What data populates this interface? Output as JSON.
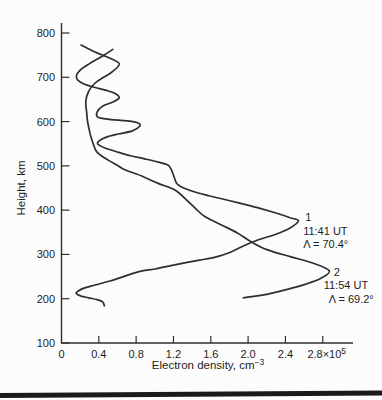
{
  "figure": {
    "bottom_rule_color": "#1a1a1a",
    "curve_color": "#2e2e2e",
    "text_color": "#1c1c1c"
  },
  "chart_data": {
    "type": "line",
    "title": "",
    "xlabel": "Electron density, cm",
    "xlabel_sup": "−3",
    "ylabel": "Height, km",
    "xlim": [
      0,
      3.12
    ],
    "ylim": [
      100,
      822
    ],
    "grid": false,
    "legend_position": "inline-annotations",
    "x_unit": "10^5 cm^-3",
    "x_ticks": [
      {
        "v": 0.0,
        "label": "0"
      },
      {
        "v": 0.4,
        "label": "0.4"
      },
      {
        "v": 0.8,
        "label": "0.8"
      },
      {
        "v": 1.2,
        "label": "1.2"
      },
      {
        "v": 1.6,
        "label": "1.6"
      },
      {
        "v": 2.0,
        "label": "2.0"
      },
      {
        "v": 2.4,
        "label": "2.4"
      },
      {
        "v": 2.8,
        "label": "2.8×10",
        "sup": "5"
      }
    ],
    "y_ticks": [
      {
        "v": 100,
        "label": "100"
      },
      {
        "v": 200,
        "label": "200"
      },
      {
        "v": 300,
        "label": "300"
      },
      {
        "v": 400,
        "label": "400"
      },
      {
        "v": 500,
        "label": "500"
      },
      {
        "v": 600,
        "label": "600"
      },
      {
        "v": 700,
        "label": "700"
      },
      {
        "v": 800,
        "label": "800"
      }
    ],
    "series": [
      {
        "name": "1",
        "time": "11:41 UT",
        "invariant_latitude": "Λ = 70.4°",
        "peak": {
          "density": 2.54,
          "height_km": 376
        },
        "points": [
          [
            0.55,
            763
          ],
          [
            0.44,
            748
          ],
          [
            0.31,
            732
          ],
          [
            0.2,
            716
          ],
          [
            0.16,
            700
          ],
          [
            0.22,
            687
          ],
          [
            0.34,
            678
          ],
          [
            0.47,
            671
          ],
          [
            0.57,
            664
          ],
          [
            0.62,
            654
          ],
          [
            0.55,
            644
          ],
          [
            0.44,
            635
          ],
          [
            0.38,
            621
          ],
          [
            0.39,
            610
          ],
          [
            0.47,
            606
          ],
          [
            0.61,
            603
          ],
          [
            0.73,
            601
          ],
          [
            0.82,
            597
          ],
          [
            0.84,
            590
          ],
          [
            0.76,
            579
          ],
          [
            0.61,
            572
          ],
          [
            0.48,
            565
          ],
          [
            0.4,
            556
          ],
          [
            0.39,
            549
          ],
          [
            0.46,
            541
          ],
          [
            0.59,
            532
          ],
          [
            0.74,
            523
          ],
          [
            0.89,
            516
          ],
          [
            1.03,
            509
          ],
          [
            1.14,
            502
          ],
          [
            1.18,
            490
          ],
          [
            1.21,
            473
          ],
          [
            1.24,
            459
          ],
          [
            1.31,
            450
          ],
          [
            1.43,
            441
          ],
          [
            1.59,
            432
          ],
          [
            1.75,
            424
          ],
          [
            1.91,
            416
          ],
          [
            2.11,
            405
          ],
          [
            2.29,
            394
          ],
          [
            2.45,
            383
          ],
          [
            2.54,
            376
          ],
          [
            2.45,
            360
          ],
          [
            2.29,
            345
          ],
          [
            2.11,
            333
          ],
          [
            1.95,
            319
          ],
          [
            1.81,
            305
          ],
          [
            1.65,
            294
          ],
          [
            1.48,
            287
          ],
          [
            1.32,
            281
          ],
          [
            1.16,
            274
          ],
          [
            1.0,
            267
          ],
          [
            0.84,
            262
          ],
          [
            0.68,
            251
          ],
          [
            0.52,
            240
          ],
          [
            0.36,
            231
          ],
          [
            0.24,
            224
          ],
          [
            0.17,
            216
          ],
          [
            0.16,
            211
          ],
          [
            0.21,
            206
          ],
          [
            0.29,
            202
          ],
          [
            0.38,
            198
          ],
          [
            0.44,
            193
          ],
          [
            0.46,
            184
          ]
        ]
      },
      {
        "name": "2",
        "time": "11:54 UT",
        "invariant_latitude": "Λ = 69.2°",
        "peak": {
          "density": 2.87,
          "height_km": 263
        },
        "points": [
          [
            0.21,
            773
          ],
          [
            0.36,
            757
          ],
          [
            0.52,
            743
          ],
          [
            0.62,
            730
          ],
          [
            0.54,
            712
          ],
          [
            0.46,
            701
          ],
          [
            0.36,
            687
          ],
          [
            0.29,
            668
          ],
          [
            0.26,
            645
          ],
          [
            0.27,
            620
          ],
          [
            0.28,
            600
          ],
          [
            0.31,
            570
          ],
          [
            0.34,
            550
          ],
          [
            0.38,
            531
          ],
          [
            0.5,
            513
          ],
          [
            0.61,
            500
          ],
          [
            0.68,
            491
          ],
          [
            0.86,
            477
          ],
          [
            1.03,
            461
          ],
          [
            1.22,
            445
          ],
          [
            1.33,
            425
          ],
          [
            1.44,
            403
          ],
          [
            1.54,
            385
          ],
          [
            1.72,
            366
          ],
          [
            1.89,
            348
          ],
          [
            2.02,
            330
          ],
          [
            2.2,
            311
          ],
          [
            2.45,
            295
          ],
          [
            2.7,
            280
          ],
          [
            2.87,
            263
          ],
          [
            2.78,
            246
          ],
          [
            2.62,
            233
          ],
          [
            2.42,
            221
          ],
          [
            2.2,
            210
          ],
          [
            2.02,
            204
          ],
          [
            1.95,
            202
          ]
        ]
      }
    ],
    "annotations": [
      {
        "anchor_x": 2.59,
        "anchor_h": 398,
        "lines": [
          {
            "text": "1",
            "dx": 2
          },
          {
            "text": "11:41 UT",
            "dx": 0
          },
          {
            "text": "Λ = 70.4°",
            "dx": 0
          }
        ]
      },
      {
        "anchor_x": 2.81,
        "anchor_h": 274,
        "lines": [
          {
            "text": "2",
            "dx": 10
          },
          {
            "text": "11:54 UT",
            "dx": 0
          },
          {
            "text": "Λ = 69.2°",
            "dx": 5
          }
        ]
      }
    ]
  }
}
